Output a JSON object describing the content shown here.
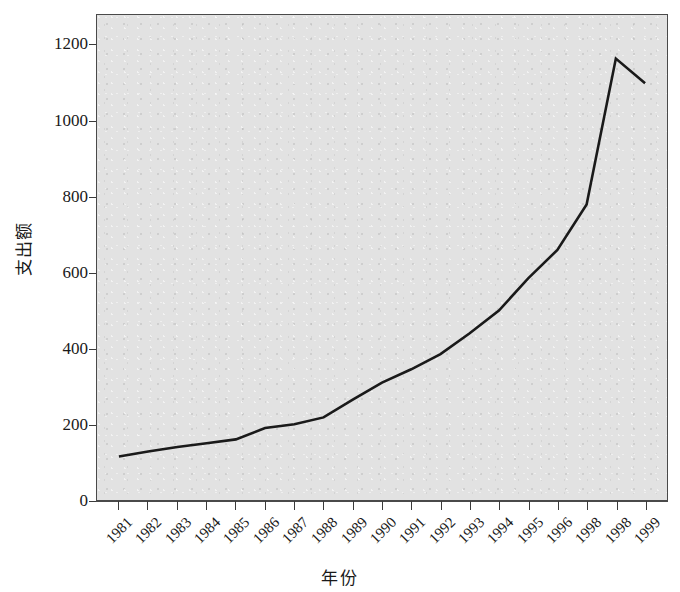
{
  "chart_data": {
    "type": "line",
    "title": "",
    "xlabel": "年份",
    "ylabel": "支出额",
    "grid": false,
    "legend": null,
    "xlim": [
      0,
      20
    ],
    "ylim": [
      0,
      1280
    ],
    "y_ticks": [
      1200,
      1000,
      800,
      600,
      400,
      200,
      0
    ],
    "y_tick_labels": [
      "1200",
      "1000",
      "800",
      "600",
      "400",
      "200",
      "0"
    ],
    "categories": [
      "1981",
      "1982",
      "1983",
      "1984",
      "1985",
      "1986",
      "1987",
      "1988",
      "1989",
      "1990",
      "1991",
      "1992",
      "1993",
      "1994",
      "1995",
      "1996",
      "1998",
      "1998",
      "1999"
    ],
    "values": [
      115,
      128,
      140,
      150,
      160,
      190,
      200,
      218,
      265,
      310,
      345,
      385,
      440,
      500,
      585,
      660,
      780,
      1165,
      1100
    ],
    "series": [
      {
        "name": "支出额",
        "color": "#1a1a1a",
        "values": [
          115,
          128,
          140,
          150,
          160,
          190,
          200,
          218,
          265,
          310,
          345,
          385,
          440,
          500,
          585,
          660,
          780,
          1165,
          1100
        ]
      }
    ]
  },
  "style": {
    "plot_background": "#e2e2e2",
    "page_background": "#ffffff",
    "axis_color": "#4a4a4a",
    "line_color": "#1a1a1a",
    "text_color": "#1a1a1a"
  }
}
